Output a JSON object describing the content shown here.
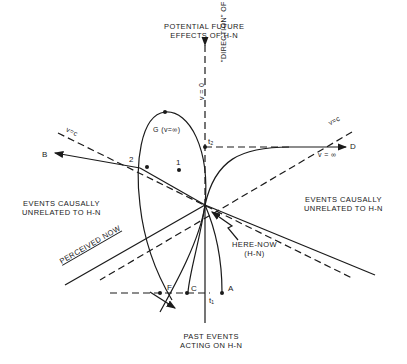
{
  "diagram": {
    "labels": {
      "future_line1": "POTENTIAL FUTURE",
      "future_line2": "EFFECTS OF H-N",
      "past_line1": "PAST EVENTS",
      "past_line2": "ACTING ON H-N",
      "left_region_line1": "EVENTS CAUSALLY",
      "left_region_line2": "UNRELATED TO H-N",
      "right_region_line1": "EVENTS CAUSALLY",
      "right_region_line2": "UNRELATED TO H-N",
      "perceived_now": "PERCEIVED NOW",
      "here_now_line1": "HERE-NOW",
      "here_now_line2": "(H-N)",
      "time_axis": "\"DIRECTION\" OF TIME",
      "v_zero": "v = 0",
      "v_c_left": "v=c",
      "v_c_right": "v=c",
      "v_inf_right": "v = ∞",
      "g_label": "G (v=∞)",
      "t1": "t₁",
      "t2": "t₂"
    },
    "points": {
      "A": "A",
      "B": "B",
      "C": "C",
      "D": "D",
      "F": "F",
      "one": "1",
      "two": "2"
    }
  }
}
